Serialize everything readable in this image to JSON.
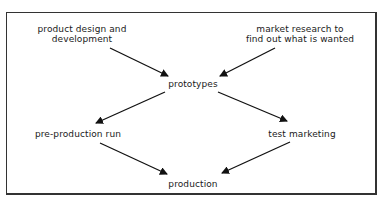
{
  "diagram": {
    "type": "flowchart",
    "nodes": [
      {
        "id": "design",
        "label_lines": [
          "product design and",
          "development"
        ]
      },
      {
        "id": "research",
        "label_lines": [
          "market research to",
          "find out what is wanted"
        ]
      },
      {
        "id": "prototypes",
        "label_lines": [
          "prototypes"
        ]
      },
      {
        "id": "preproduction",
        "label_lines": [
          "pre-production run"
        ]
      },
      {
        "id": "testmarketing",
        "label_lines": [
          "test marketing"
        ]
      },
      {
        "id": "production",
        "label_lines": [
          "production"
        ]
      }
    ],
    "edges": [
      {
        "from": "design",
        "to": "prototypes"
      },
      {
        "from": "research",
        "to": "prototypes"
      },
      {
        "from": "prototypes",
        "to": "preproduction"
      },
      {
        "from": "prototypes",
        "to": "testmarketing"
      },
      {
        "from": "preproduction",
        "to": "production"
      },
      {
        "from": "testmarketing",
        "to": "production"
      }
    ],
    "colors": {
      "line": "#111111",
      "border": "#333333",
      "background": "#ffffff"
    }
  }
}
